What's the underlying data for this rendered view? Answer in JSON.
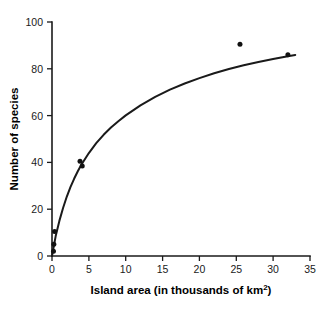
{
  "chart_data": {
    "type": "scatter",
    "title": "",
    "xlabel": "Island area (in thousands of km2)",
    "xlabel_base": "Island area (in thousands of km",
    "xlabel_sup": "2",
    "xlabel_tail": ")",
    "ylabel": "Number of species",
    "xlim": [
      0,
      35
    ],
    "ylim": [
      0,
      100
    ],
    "xticks": [
      0,
      5,
      10,
      15,
      20,
      25,
      30,
      35
    ],
    "yticks": [
      0,
      20,
      40,
      60,
      80,
      100
    ],
    "xtick_labels": [
      "0",
      "5",
      "10",
      "15",
      "20",
      "25",
      "30",
      "35"
    ],
    "ytick_labels": [
      "0",
      "20",
      "40",
      "60",
      "80",
      "100"
    ],
    "grid": false,
    "legend": false,
    "marker_color": "#111111",
    "curve_color": "#1a1a1a",
    "axis_color": "#1a1a1a",
    "background_color": "#ffffff",
    "points": [
      {
        "x": 0.2,
        "y": 2
      },
      {
        "x": 0.25,
        "y": 5
      },
      {
        "x": 0.35,
        "y": 10.5
      },
      {
        "x": 3.8,
        "y": 40.5
      },
      {
        "x": 4.1,
        "y": 38.5
      },
      {
        "x": 25.5,
        "y": 90.5
      },
      {
        "x": 32.0,
        "y": 86.0
      }
    ],
    "series": [
      {
        "name": "Observed islands",
        "x": [
          0.2,
          0.25,
          0.35,
          3.8,
          4.1,
          25.5,
          32.0
        ],
        "values": [
          2,
          5,
          10.5,
          40.5,
          38.5,
          90.5,
          86.0
        ]
      }
    ],
    "fit_curve": {
      "name": "Fitted saturation curve",
      "model": "saturating",
      "x": [
        0.0,
        0.5,
        1.0,
        1.5,
        2.0,
        2.5,
        3.0,
        3.5,
        4.0,
        5.0,
        6.0,
        7.0,
        8.0,
        9.0,
        10.0,
        12.0,
        14.0,
        16.0,
        18.0,
        20.0,
        22.0,
        24.0,
        26.0,
        28.0,
        30.0,
        32.0,
        33.0
      ],
      "values": [
        0.0,
        8.5,
        15.0,
        20.5,
        25.3,
        29.4,
        33.0,
        36.2,
        39.1,
        44.0,
        48.2,
        51.8,
        54.9,
        57.6,
        60.1,
        64.4,
        68.0,
        71.1,
        73.7,
        76.0,
        78.1,
        79.9,
        81.5,
        82.9,
        84.2,
        85.4,
        85.9
      ]
    }
  }
}
